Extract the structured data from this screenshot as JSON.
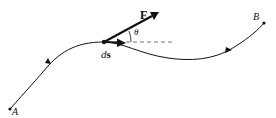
{
  "diagram": {
    "labels": {
      "start_point": "A",
      "end_point": "B",
      "force": "F",
      "displacement_d": "d",
      "displacement_s": "s",
      "angle": "θ"
    },
    "colors": {
      "stroke": "#111111",
      "dashed": "#777777",
      "background": "#ffffff"
    }
  }
}
